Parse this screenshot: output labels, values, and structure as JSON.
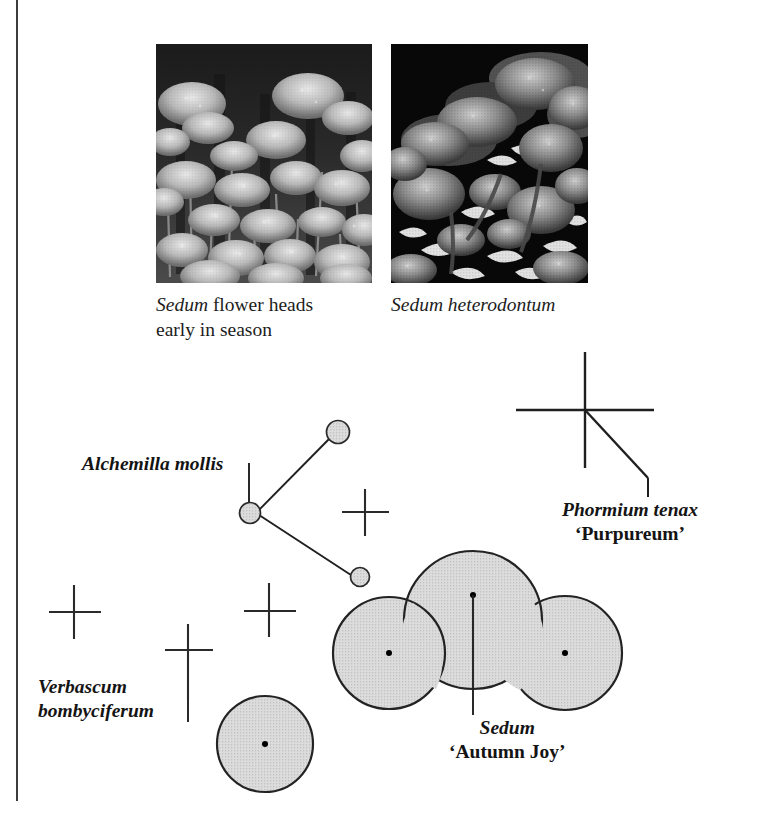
{
  "page": {
    "background_color": "#ffffff",
    "rule_color": "#3c3c3c"
  },
  "photos": [
    {
      "name": "sedum-flower-heads",
      "description": "Grayscale photograph of pale Sedum flower heads massed on upright stems against a dark background",
      "caption_lines": [
        "Sedum flower heads",
        "early in season"
      ],
      "caption_italic_word": "Sedum"
    },
    {
      "name": "sedum-heterodontum",
      "description": "Grayscale photograph of dense rounded Sedum heterodontum flower clusters with pale leaves against a black background",
      "caption_lines": [
        "Sedum heterodontum"
      ],
      "caption_italic_word": "Sedum heterodontum"
    }
  ],
  "captions": {
    "left": {
      "line1_italic": "Sedum",
      "line1_rest": " flower heads",
      "line2": "early in season"
    },
    "right": {
      "line1_italic": "Sedum heterodontum"
    }
  },
  "plan": {
    "fill_color": "#d9d9d9",
    "outline_color": "#222222",
    "dot_color": "#000000",
    "leader_color": "#1a1a1a",
    "labels": [
      {
        "name": "alchemilla-mollis",
        "scientific": "Alchemilla mollis",
        "cultivar": ""
      },
      {
        "name": "phormium-tenax-purpureum",
        "scientific": "Phormium tenax",
        "cultivar": "‘Purpureum’"
      },
      {
        "name": "verbascum-bombyciferum",
        "scientific_line1": "Verbascum",
        "scientific_line2": "bombyciferum"
      },
      {
        "name": "sedum-autumn-joy",
        "scientific": "Sedum",
        "cultivar": "‘Autumn Joy’"
      }
    ],
    "symbols": {
      "large_circles": 4,
      "small_circles": 3,
      "crosses": 4,
      "spiky_cross": 1
    }
  }
}
